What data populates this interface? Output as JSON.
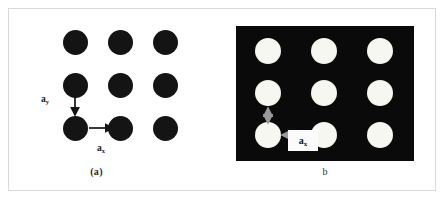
{
  "figure": {
    "background_color": "#ffffff",
    "border_color": "#d9d9d9"
  },
  "panel_a": {
    "caption": "(a)",
    "lattice": {
      "kind": "square-lattice-of-dots",
      "rows": 3,
      "cols": 3,
      "dot_color": "#141414",
      "dot_diameter_px": 25,
      "spacing_x_px": 45,
      "spacing_y_px": 43,
      "background_color": "#ffffff",
      "centers": [
        [
          56,
          31
        ],
        [
          101,
          31
        ],
        [
          146,
          31
        ],
        [
          56,
          74
        ],
        [
          101,
          74
        ],
        [
          146,
          74
        ],
        [
          56,
          117
        ],
        [
          101,
          117
        ],
        [
          146,
          117
        ]
      ]
    },
    "vectors": {
      "ay": {
        "label": "a",
        "subscript": "y",
        "type": "single-headed-arrow",
        "direction": "down",
        "color": "#141414"
      },
      "ax": {
        "label": "a",
        "subscript": "x",
        "type": "single-headed-arrow",
        "direction": "right",
        "color": "#141414"
      }
    }
  },
  "panel_b": {
    "caption": "b",
    "lattice": {
      "kind": "sem-micrograph-of-bright-dots",
      "rows": 3,
      "cols": 3,
      "dot_color": "#f7f7f2",
      "dot_diameter_px": 26,
      "spacing_x_px": 56,
      "spacing_y_px": 42,
      "background_color": "#0a0a0a",
      "centers": [
        [
          32,
          25
        ],
        [
          88,
          25
        ],
        [
          144,
          25
        ],
        [
          32,
          67
        ],
        [
          88,
          67
        ],
        [
          144,
          67
        ],
        [
          32,
          109
        ],
        [
          88,
          109
        ],
        [
          144,
          109
        ]
      ]
    },
    "vectors": {
      "ay": {
        "label": "",
        "subscript": "",
        "type": "double-headed-arrow",
        "direction": "vertical",
        "color": "#9a9a9a"
      },
      "ax": {
        "label": "a",
        "subscript": "x",
        "type": "double-headed-arrow",
        "direction": "horizontal",
        "color": "#9a9a9a"
      }
    },
    "label_box_color": "#fbfbfb"
  }
}
